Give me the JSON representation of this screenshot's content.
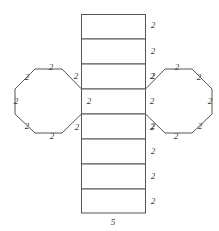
{
  "figure": {
    "width": 219,
    "height": 231,
    "stroke_color": "#555555",
    "fill_color": "#ffffff",
    "label_color": "#3a3a3a"
  },
  "geometry": {
    "column": {
      "name": "lateral-faces-column",
      "x_left": 81,
      "x_right": 146,
      "y_top": 14,
      "y_bottom": 213,
      "divider_y": [
        39,
        64,
        89,
        114,
        139,
        164,
        189
      ],
      "face_count": 8
    },
    "left_octagon": {
      "name": "left-octagon-base",
      "cx": 48,
      "cy": 101,
      "x_min": 15,
      "x_max": 81,
      "y_min": 68,
      "y_max": 135,
      "sides": 8,
      "points": "81,89 81,114 62,133 35,133 15,114 15,89 35,69 62,69"
    },
    "right_octagon": {
      "name": "right-octagon-base",
      "cx": 179,
      "cy": 101,
      "x_min": 146,
      "x_max": 212,
      "y_min": 68,
      "y_max": 135,
      "sides": 8,
      "points": "146,89 165,69 192,69 212,89 212,114 192,133 165,133 146,114"
    }
  },
  "labels": {
    "column_right": [
      {
        "text": "2",
        "x": 153,
        "y": 25
      },
      {
        "text": "2",
        "x": 153,
        "y": 51
      },
      {
        "text": "2",
        "x": 153,
        "y": 76
      },
      {
        "text": "2",
        "x": 152,
        "y": 101
      },
      {
        "text": "2",
        "x": 153,
        "y": 126
      },
      {
        "text": "2",
        "x": 153,
        "y": 151
      },
      {
        "text": "2",
        "x": 153,
        "y": 176
      },
      {
        "text": "2",
        "x": 153,
        "y": 201
      }
    ],
    "column_left_inner": [
      {
        "text": "2",
        "x": 89,
        "y": 101
      }
    ],
    "column_bottom": [
      {
        "text": "5",
        "x": 113,
        "y": 222
      }
    ],
    "left_octagon_sides": [
      {
        "text": "2",
        "x": 51,
        "y": 67
      },
      {
        "text": "2",
        "x": 27,
        "y": 77
      },
      {
        "text": "2",
        "x": 16,
        "y": 101
      },
      {
        "text": "2",
        "x": 27,
        "y": 126
      },
      {
        "text": "2",
        "x": 52,
        "y": 136
      },
      {
        "text": "2",
        "x": 77,
        "y": 127
      },
      {
        "text": "2",
        "x": 76,
        "y": 76
      }
    ],
    "right_octagon_sides": [
      {
        "text": "2",
        "x": 177,
        "y": 67
      },
      {
        "text": "2",
        "x": 199,
        "y": 77
      },
      {
        "text": "2",
        "x": 210,
        "y": 101
      },
      {
        "text": "2",
        "x": 200,
        "y": 126
      },
      {
        "text": "2",
        "x": 176,
        "y": 136
      },
      {
        "text": "2",
        "x": 152,
        "y": 127
      },
      {
        "text": "2",
        "x": 152,
        "y": 76
      }
    ]
  }
}
